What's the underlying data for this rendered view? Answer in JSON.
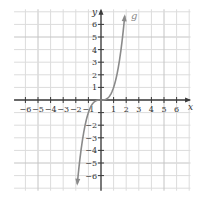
{
  "chart_data": {
    "type": "line",
    "title": "",
    "xlabel": "x",
    "ylabel": "y",
    "xlim": [
      -7,
      7
    ],
    "ylim": [
      -7,
      7
    ],
    "grid": true,
    "x_ticks": [
      -6,
      -5,
      -4,
      -3,
      -2,
      -1,
      1,
      2,
      3,
      4,
      5,
      6
    ],
    "x_tick_labels": [
      "−6",
      "−5",
      "−4",
      "−3",
      "−2",
      "−1",
      "1",
      "2",
      "3",
      "4",
      "5",
      "6"
    ],
    "y_ticks": [
      6,
      5,
      4,
      3,
      2,
      1,
      -1,
      -2,
      -3,
      -4,
      -5,
      -6
    ],
    "y_tick_labels": [
      "6",
      "5",
      "4",
      "3",
      "2",
      "1",
      "−1",
      "−2",
      "−3",
      "−4",
      "−5",
      "−6"
    ],
    "visible_y_tick_labels": [
      "6",
      "5",
      "4",
      "3",
      "2",
      "1",
      "−2",
      "−3",
      "−4",
      "−5",
      "−6"
    ],
    "series": [
      {
        "name": "g",
        "label": "g",
        "function": "x^3",
        "x": [
          -1.9,
          -1.5,
          -1.0,
          -0.5,
          0,
          0.5,
          1.0,
          1.5,
          1.9
        ],
        "y": [
          -6.86,
          -3.375,
          -1.0,
          -0.125,
          0,
          0.125,
          1.0,
          3.375,
          6.86
        ],
        "arrows_at_ends": true
      }
    ],
    "colors": {
      "curve": "#8a8a8a",
      "axis": "#3a3a3a",
      "grid": "#dcdcdc",
      "grid_major": "#c4c4c4"
    }
  },
  "labels": {
    "x_axis": "x",
    "y_axis": "y",
    "curve": "g"
  }
}
